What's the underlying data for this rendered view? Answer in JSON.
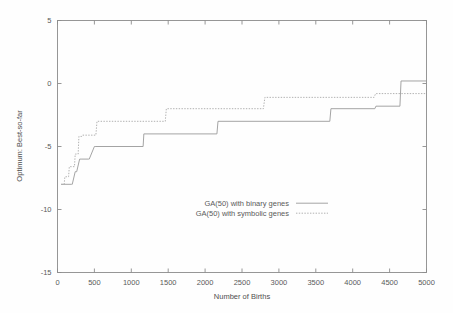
{
  "chart_data": {
    "type": "line",
    "title": "",
    "xlabel": "Number of Births",
    "ylabel": "Optimum: Best-so-far",
    "xlim": [
      0,
      5000
    ],
    "ylim": [
      -15,
      5
    ],
    "xticks": [
      0,
      500,
      1000,
      1500,
      2000,
      2500,
      3000,
      3500,
      4000,
      4500,
      5000
    ],
    "xtick_labels": [
      "0",
      "500",
      "1000",
      "1500",
      "2000",
      "2500",
      "3000",
      "3500",
      "4000",
      "4500",
      "5000"
    ],
    "yticks": [
      5,
      0,
      -5,
      -10,
      -15
    ],
    "ytick_labels": [
      "5",
      "0",
      "-5",
      "-10",
      "-15"
    ],
    "grid": false,
    "legend_position": "center",
    "series": [
      {
        "name": "GA(50) with binary genes",
        "style": "solid",
        "color": "#9a9a9a",
        "x": [
          50,
          190,
          200,
          240,
          260,
          300,
          320,
          420,
          430,
          500,
          510,
          1160,
          1170,
          2160,
          2175,
          3690,
          3705,
          4300,
          4315,
          4640,
          4655,
          5000
        ],
        "y": [
          -8,
          -8,
          -8,
          -7,
          -7,
          -6,
          -6,
          -6,
          -6,
          -5,
          -5,
          -5,
          -4,
          -4,
          -3,
          -3,
          -2,
          -2,
          -1.8,
          -1.8,
          0.2,
          0.2
        ]
      },
      {
        "name": "GA(50) with symbolic genes",
        "style": "dotted",
        "color": "#a8a8a8",
        "x": [
          50,
          90,
          100,
          150,
          160,
          230,
          240,
          280,
          290,
          330,
          340,
          520,
          535,
          1460,
          1475,
          2790,
          2810,
          4290,
          4310,
          5000
        ],
        "y": [
          -8,
          -8,
          -7.4,
          -7.4,
          -6.6,
          -6.6,
          -5.6,
          -5.6,
          -4.2,
          -4.2,
          -4.1,
          -4.1,
          -3,
          -3,
          -2,
          -2,
          -1.1,
          -1.1,
          -0.8,
          -0.8
        ]
      }
    ]
  },
  "legend": {
    "entries": [
      {
        "label": "GA(50) with binary genes",
        "style": "solid"
      },
      {
        "label": "GA(50) with symbolic genes",
        "style": "dotted"
      }
    ]
  }
}
